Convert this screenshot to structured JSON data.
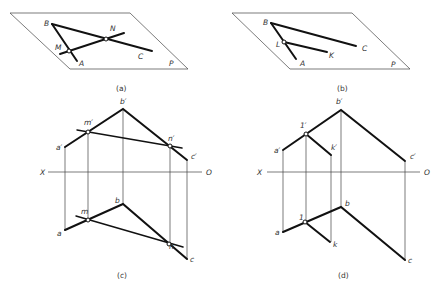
{
  "figure": {
    "panels": [
      {
        "id": "a",
        "caption": "(a)",
        "plane_label": "P",
        "labels": {
          "B": "B",
          "N": "N",
          "M": "M",
          "A": "A",
          "C": "C"
        }
      },
      {
        "id": "b",
        "caption": "(b)",
        "plane_label": "P",
        "labels": {
          "B": "B",
          "L": "L",
          "A": "A",
          "K": "K",
          "C": "C"
        }
      },
      {
        "id": "c",
        "caption": "(c)",
        "axis": {
          "left": "X",
          "right": "O"
        },
        "front_labels": {
          "b": "b′",
          "m": "m′",
          "a": "a′",
          "n": "n′",
          "c": "c′"
        },
        "top_labels": {
          "b": "b",
          "m": "m",
          "a": "a",
          "n": "n",
          "c": "c"
        }
      },
      {
        "id": "d",
        "caption": "(d)",
        "axis": {
          "left": "X",
          "right": "O"
        },
        "front_labels": {
          "b": "b′",
          "one": "1′",
          "a": "a′",
          "k": "k′",
          "c": "c′"
        },
        "top_labels": {
          "b": "b",
          "one": "1",
          "a": "a",
          "k": "k",
          "c": "c"
        }
      }
    ]
  }
}
